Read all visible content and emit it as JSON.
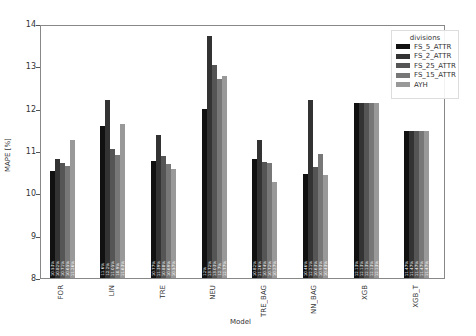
{
  "chart_data": {
    "type": "bar",
    "title": "",
    "xlabel": "Model",
    "ylabel": "MAPE [%]",
    "ylim": [
      8,
      14
    ],
    "yticks": [
      8,
      9,
      10,
      11,
      12,
      13,
      14
    ],
    "grid": false,
    "legend_title": "divisions",
    "legend_position": "upper right",
    "categories": [
      "FOR",
      "LIN",
      "TRE",
      "NEU",
      "TRE_BAG",
      "NN_BAG",
      "XGB",
      "XGB_T"
    ],
    "series": [
      {
        "name": "FS_5_ATTR",
        "color": "#111111",
        "values": [
          10.53,
          11.6,
          10.77,
          12.0,
          10.82,
          10.46,
          12.13,
          11.47
        ]
      },
      {
        "name": "FS_2_ATTR",
        "color": "#333333",
        "values": [
          10.82,
          12.2,
          11.39,
          13.72,
          11.26,
          12.21,
          12.13,
          11.47
        ]
      },
      {
        "name": "FS_25_ATTR",
        "color": "#555555",
        "values": [
          10.71,
          11.05,
          10.88,
          13.03,
          10.74,
          10.63,
          12.13,
          11.47
        ]
      },
      {
        "name": "FS_15_ATTR",
        "color": "#777777",
        "values": [
          10.65,
          10.9,
          10.69,
          12.7,
          10.72,
          10.93,
          12.13,
          11.47
        ]
      },
      {
        "name": "AYH",
        "color": "#999999",
        "values": [
          11.26,
          11.63,
          10.57,
          12.77,
          10.27,
          10.43,
          12.13,
          11.47
        ]
      }
    ]
  }
}
